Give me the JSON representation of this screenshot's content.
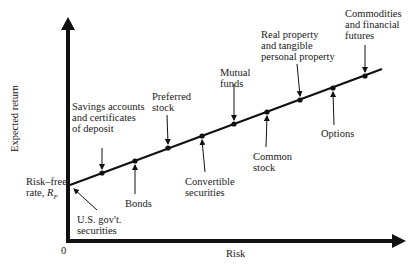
{
  "figure": {
    "x_axis_label": "Risk",
    "y_axis_label": "Expected return",
    "origin_label": "0",
    "risk_free_label_line1": "Risk–free",
    "risk_free_label_line2": "rate, ",
    "risk_free_symbol": "R",
    "risk_free_subscript": "F"
  },
  "securities": [
    {
      "name": "U.S. gov't. securities",
      "lines": [
        "U.S. gov't.",
        "securities"
      ],
      "position": "below"
    },
    {
      "name": "Savings accounts and certificates of deposit",
      "lines": [
        "Savings accounts",
        "and certificates",
        "of deposit"
      ],
      "position": "above"
    },
    {
      "name": "Bonds",
      "lines": [
        "Bonds"
      ],
      "position": "below"
    },
    {
      "name": "Preferred stock",
      "lines": [
        "Preferred",
        "stock"
      ],
      "position": "above"
    },
    {
      "name": "Convertible securities",
      "lines": [
        "Convertible",
        "securities"
      ],
      "position": "below"
    },
    {
      "name": "Mutual funds",
      "lines": [
        "Mutual",
        "funds"
      ],
      "position": "above"
    },
    {
      "name": "Common stock",
      "lines": [
        "Common",
        "stock"
      ],
      "position": "below"
    },
    {
      "name": "Real property and tangible personal property",
      "lines": [
        "Real property",
        "and tangible",
        "personal property"
      ],
      "position": "above"
    },
    {
      "name": "Options",
      "lines": [
        "Options"
      ],
      "position": "below"
    },
    {
      "name": "Commodities and financial futures",
      "lines": [
        "Commodities",
        "and financial",
        "futures"
      ],
      "position": "above"
    }
  ],
  "colors": {
    "ink": "#111111",
    "background": "#ffffff"
  }
}
